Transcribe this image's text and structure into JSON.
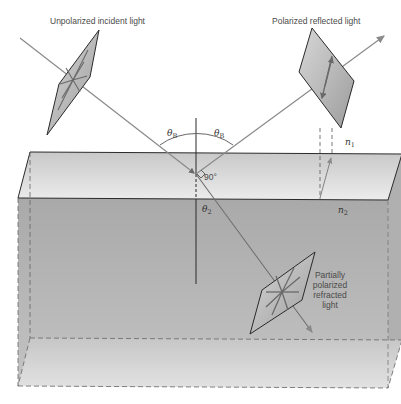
{
  "labels": {
    "incident": "Unpolarized incident light",
    "reflected": "Polarized reflected light",
    "refracted_lines": [
      "Partially",
      "polarized",
      "refracted",
      "light"
    ],
    "theta_b_left": "θ",
    "theta_b_right": "θ",
    "theta_b_sub": "B",
    "theta_2": "θ",
    "theta_2_sub": "2",
    "right_angle": "90°",
    "n1": "n",
    "n1_sub": "1",
    "n2": "n",
    "n2_sub": "2"
  },
  "colors": {
    "ray": "#8a8a8a",
    "edge": "#2a2a2a",
    "top_face": "#dcdcdc",
    "front_face": "#b4b4b4",
    "side_face": "#a8a8a8",
    "bottom_face": "#d2d2d2",
    "polarizer": "#bdbdbd"
  }
}
